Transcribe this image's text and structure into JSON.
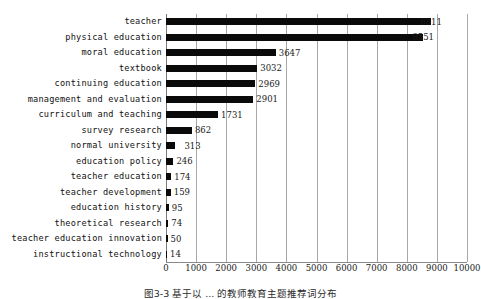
{
  "chart_data": {
    "type": "bar",
    "orientation": "horizontal",
    "title": "",
    "xlabel": "",
    "ylabel": "",
    "xlim": [
      0,
      10000
    ],
    "xticks": [
      0,
      1000,
      2000,
      3000,
      4000,
      5000,
      6000,
      7000,
      8000,
      9000,
      10000
    ],
    "xtick_labels": [
      "0",
      "1000",
      "2000",
      "3000",
      "4000",
      "5000",
      "6000",
      "7000",
      "8000",
      "9000",
      "10000"
    ],
    "grid": true,
    "grid_axis": "x",
    "legend": false,
    "bar_color": "#0a0a0a",
    "categories": [
      "teacher",
      "physical education",
      "moral education",
      "textbook",
      "continuing education",
      "management and evaluation",
      "curriculum and teaching",
      "survey research",
      "normal university",
      "education policy",
      "teacher education",
      "teacher development",
      "education history",
      "theoretical research",
      "teacher education innovation",
      "instructional technology"
    ],
    "values": [
      8811,
      8551,
      3647,
      3032,
      2969,
      2901,
      1731,
      862,
      313,
      246,
      174,
      159,
      95,
      74,
      50,
      14
    ],
    "value_labels": [
      "8811",
      "8551",
      "3647",
      "3032",
      "2969",
      "2901",
      "1731",
      "862",
      "313",
      "246",
      "174",
      "159",
      "95",
      "74",
      "50",
      "14"
    ]
  },
  "caption": {
    "text": "图3-3 基于以 ... 的教师教育主题推荐词分布"
  }
}
